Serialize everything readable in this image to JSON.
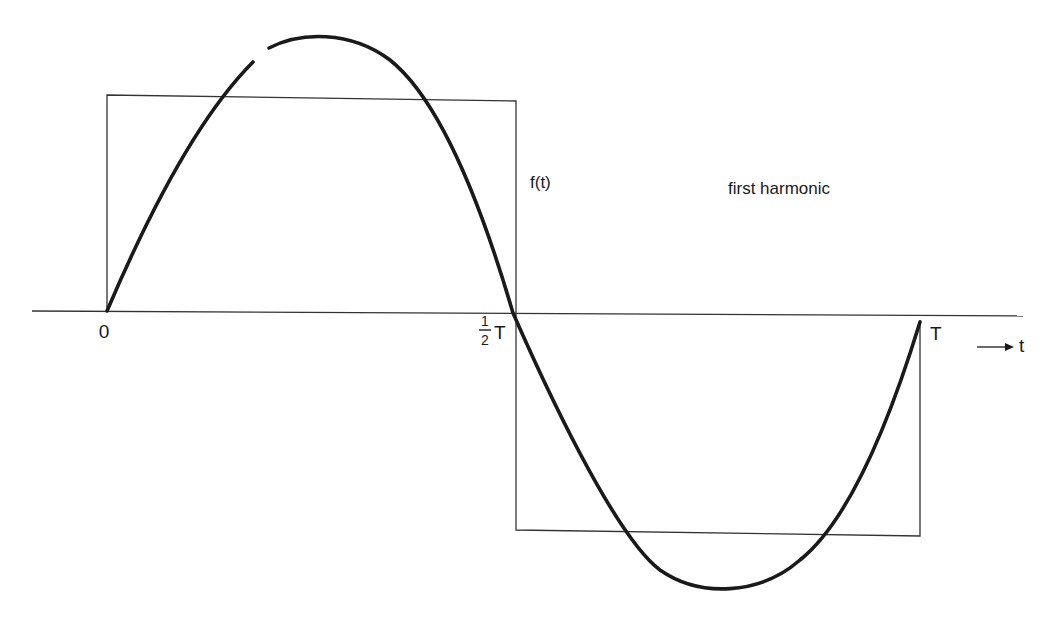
{
  "figure": {
    "title": "first harmonic",
    "function_label": "f(t)",
    "axis": {
      "variable": "t",
      "arrow_label": "⟶ t",
      "ticks": [
        {
          "label": "0",
          "value": "0"
        },
        {
          "label_num": "1",
          "label_den": "2",
          "label_suffix": "T",
          "value": "T/2"
        },
        {
          "label": "T",
          "value": "T"
        }
      ]
    },
    "curves": [
      {
        "name": "square-wave",
        "description": "f(t): +A on (0, T/2), -A on (T/2, T)"
      },
      {
        "name": "first-harmonic",
        "description": "fundamental sine component, amplitude 4A/π"
      }
    ],
    "colors": {
      "ink": "#1a1a1a",
      "thin_line": "#333333",
      "background": "#ffffff"
    }
  }
}
